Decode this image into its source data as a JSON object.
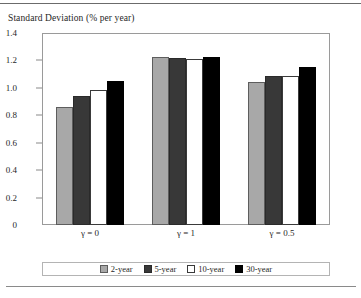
{
  "chart_data": {
    "type": "bar",
    "title": "Standard Deviation (% per year)",
    "xlabel": "",
    "ylabel": "",
    "categories": [
      "γ = 0",
      "γ = 1",
      "γ = 0.5"
    ],
    "series": [
      {
        "name": "2-year",
        "color": "#a8a8a8",
        "values": [
          0.86,
          1.225,
          1.04
        ]
      },
      {
        "name": "5-year",
        "color": "#383838",
        "values": [
          0.94,
          1.215,
          1.085
        ]
      },
      {
        "name": "10-year",
        "color": "#ffffff",
        "values": [
          0.985,
          1.21,
          1.09
        ]
      },
      {
        "name": "30-year",
        "color": "#000000",
        "values": [
          1.05,
          1.225,
          1.15
        ]
      }
    ],
    "ylim": [
      0,
      1.4
    ],
    "ytick_values": [
      0,
      0.2,
      0.4,
      0.6,
      0.8,
      1.0,
      1.2,
      1.4
    ],
    "ytick_labels": [
      "0",
      "0.2",
      "0.4",
      "0.6",
      "0.8",
      "1.0",
      "1.2",
      "1.4"
    ],
    "grid": false,
    "legend_position": "bottom"
  }
}
